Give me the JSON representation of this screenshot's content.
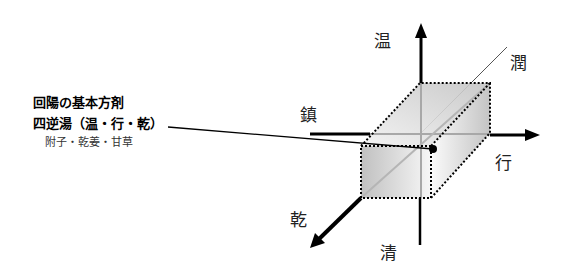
{
  "annotation": {
    "heading": "回陽の基本方剤",
    "formula": "四逆湯（温・行・乾）",
    "ingredients": "附子・乾姜・甘草"
  },
  "axes": {
    "up": "温",
    "down": "清",
    "left": "鎮",
    "right": "行",
    "diagonal_back": "潤",
    "diagonal_front": "乾"
  },
  "colors": {
    "axis": "#000000",
    "box_fill_light": "#f4f4f4",
    "box_fill_dark": "#b8b8b8",
    "guide_line": "#a0a0a0"
  }
}
